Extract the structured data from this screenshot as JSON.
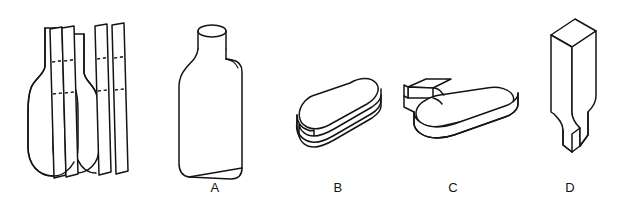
{
  "page": {
    "background_color": "#ffffff",
    "ink_color": "#141414",
    "width": 620,
    "height": 202
  },
  "stimulus": {
    "name": "bottle-with-cutting-strips",
    "description": "Outline of a bottle overlaid by four vertical slab strips marked with dashed cut lines",
    "bottle_count": 2,
    "strip_count": 4,
    "dashed_cut_marks": 6
  },
  "options": [
    {
      "id": "A",
      "label": "A",
      "label_x": 215,
      "label_y": 192,
      "shape": "upright-flat-bottle-solid"
    },
    {
      "id": "B",
      "label": "B",
      "label_x": 338,
      "label_y": 192,
      "shape": "horizontal-stadium-slab"
    },
    {
      "id": "C",
      "label": "C",
      "label_x": 453,
      "label_y": 192,
      "shape": "horizontal-bottle-slab-with-neck"
    },
    {
      "id": "D",
      "label": "D",
      "label_x": 570,
      "label_y": 192,
      "shape": "upright-bottle-slab-with-notch"
    }
  ]
}
